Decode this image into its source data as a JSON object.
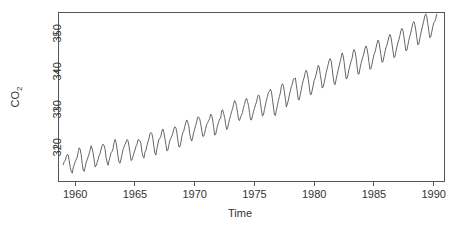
{
  "chart_data": {
    "type": "line",
    "title": "",
    "subtitle": "",
    "xlabel": "Time",
    "ylabel": "CO2",
    "ylabel_display": "CO",
    "ylabel_subscript": "2",
    "xlim": [
      1958.6,
      1990.9
    ],
    "ylim": [
      311.0,
      355.5
    ],
    "xticks": [
      1960,
      1965,
      1970,
      1975,
      1980,
      1985,
      1990
    ],
    "xtick_labels": [
      "1960",
      "1965",
      "1970",
      "1975",
      "1980",
      "1985",
      "1990"
    ],
    "yticks": [
      320,
      330,
      340,
      350
    ],
    "ytick_labels": [
      "320",
      "330",
      "340",
      "350"
    ],
    "grid": false,
    "legend": "none",
    "series": [
      {
        "name": "Mauna Loa CO2 (ppm), monthly",
        "color": "#555555",
        "x_start": 1959.0,
        "x_step": 0.08333333,
        "values": [
          315.42,
          316.31,
          316.5,
          317.56,
          318.13,
          318.0,
          316.39,
          314.65,
          313.68,
          313.18,
          314.66,
          315.43,
          316.27,
          316.81,
          317.42,
          318.87,
          319.87,
          319.43,
          318.01,
          315.74,
          314.0,
          313.68,
          314.84,
          316.03,
          316.73,
          317.54,
          318.38,
          319.31,
          320.42,
          319.61,
          318.42,
          316.63,
          314.83,
          315.16,
          315.94,
          316.85,
          317.78,
          318.4,
          319.53,
          320.42,
          320.85,
          320.45,
          319.45,
          317.25,
          316.11,
          315.27,
          316.53,
          317.53,
          318.58,
          318.92,
          319.7,
          321.22,
          322.08,
          321.31,
          319.58,
          317.61,
          316.05,
          315.83,
          316.91,
          318.2,
          319.41,
          320.07,
          320.74,
          321.4,
          322.06,
          321.73,
          320.27,
          318.54,
          316.54,
          316.71,
          317.53,
          318.55,
          319.27,
          320.28,
          320.73,
          321.97,
          322.0,
          321.71,
          321.05,
          318.71,
          317.66,
          317.14,
          318.7,
          319.25,
          320.46,
          321.43,
          322.23,
          323.54,
          323.91,
          323.59,
          322.24,
          320.2,
          318.48,
          317.94,
          319.63,
          320.87,
          322.17,
          322.34,
          322.88,
          324.25,
          324.83,
          323.93,
          322.38,
          320.76,
          319.1,
          319.24,
          320.56,
          321.8,
          322.4,
          322.99,
          323.73,
          324.86,
          325.4,
          325.2,
          323.98,
          321.95,
          320.18,
          320.09,
          321.16,
          322.74,
          323.83,
          324.26,
          325.47,
          326.5,
          327.21,
          326.54,
          325.72,
          323.5,
          322.22,
          321.62,
          322.69,
          323.95,
          324.89,
          325.82,
          326.77,
          327.97,
          327.91,
          327.5,
          326.18,
          324.53,
          322.93,
          322.9,
          323.85,
          324.96,
          326.01,
          326.51,
          327.01,
          327.62,
          328.76,
          328.4,
          327.2,
          325.27,
          323.2,
          323.4,
          324.63,
          325.85,
          326.6,
          327.47,
          327.58,
          329.56,
          329.9,
          328.92,
          327.88,
          326.16,
          324.68,
          325.04,
          326.34,
          327.39,
          328.37,
          329.4,
          330.14,
          331.33,
          332.31,
          331.9,
          330.7,
          329.15,
          327.35,
          327.02,
          327.99,
          328.48,
          329.18,
          330.55,
          331.32,
          332.48,
          332.92,
          332.08,
          331.01,
          329.23,
          327.27,
          327.21,
          328.29,
          329.41,
          330.23,
          331.25,
          331.87,
          333.14,
          333.8,
          333.43,
          331.73,
          329.73,
          328.24,
          328.5,
          329.98,
          331.15,
          332.41,
          333.37,
          334.41,
          334.71,
          335.3,
          334.66,
          332.76,
          330.62,
          328.57,
          328.34,
          329.85,
          330.98,
          332.33,
          333.34,
          334.35,
          336.09,
          336.74,
          336.27,
          334.68,
          332.76,
          330.62,
          331.42,
          332.37,
          333.77,
          334.86,
          336.0,
          336.63,
          337.93,
          338.04,
          338.27,
          336.53,
          334.65,
          332.52,
          332.55,
          333.88,
          335.2,
          336.62,
          337.64,
          338.48,
          339.71,
          340.3,
          339.5,
          337.95,
          336.03,
          333.95,
          333.93,
          335.09,
          336.38,
          337.62,
          338.32,
          339.29,
          340.55,
          341.61,
          341.14,
          339.21,
          337.62,
          335.61,
          335.88,
          336.97,
          338.38,
          339.73,
          340.72,
          341.84,
          342.94,
          343.38,
          342.73,
          340.8,
          338.55,
          336.73,
          336.49,
          337.93,
          339.18,
          340.31,
          341.42,
          342.58,
          343.64,
          344.86,
          344.18,
          342.45,
          340.17,
          338.09,
          338.14,
          339.34,
          340.67,
          341.66,
          342.7,
          343.44,
          345.03,
          345.73,
          345.17,
          343.63,
          341.27,
          339.3,
          339.32,
          340.85,
          342.07,
          343.01,
          344.0,
          344.82,
          346.13,
          346.69,
          345.95,
          344.42,
          342.36,
          340.51,
          340.79,
          341.9,
          343.24,
          344.41,
          345.1,
          346.14,
          347.35,
          348.24,
          347.75,
          346.01,
          344.33,
          342.43,
          342.54,
          343.81,
          345.12,
          346.22,
          346.92,
          347.94,
          349.11,
          349.73,
          349.0,
          347.39,
          345.46,
          343.63,
          343.83,
          345.19,
          346.43,
          347.48,
          348.33,
          349.43,
          350.74,
          351.3,
          350.85,
          349.18,
          347.31,
          345.43,
          345.58,
          346.88,
          348.2,
          349.27,
          350.2,
          351.43,
          352.7,
          353.09,
          352.39,
          350.79,
          348.86,
          346.99,
          347.2,
          348.61,
          349.89,
          351.17,
          352.22,
          353.32,
          354.62,
          355.13,
          354.37,
          352.6,
          350.76,
          348.86,
          349.1,
          350.35,
          351.71,
          352.74,
          353.12,
          353.85,
          355.05
        ]
      }
    ]
  },
  "axes": {
    "x_label": "Time",
    "y_label_main": "CO",
    "y_label_sub": "2"
  },
  "colors": {
    "line": "#555555",
    "axis": "#555555",
    "text": "#333333",
    "background": "#ffffff"
  }
}
